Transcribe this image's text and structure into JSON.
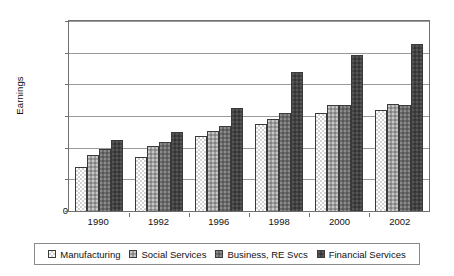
{
  "chart_data": {
    "type": "bar",
    "title": "",
    "xlabel": "",
    "ylabel": "Earnings",
    "ylim": [
      0,
      6000
    ],
    "yticks": [
      0,
      1000,
      2000,
      3000,
      4000,
      5000,
      6000
    ],
    "ytick_labels": [
      "0",
      "1,000",
      "2,000",
      "3,000",
      "4,000",
      "5,000",
      "6,000"
    ],
    "grid": true,
    "legend_position": "bottom",
    "categories": [
      "1990",
      "1992",
      "1996",
      "1998",
      "2000",
      "2002"
    ],
    "series": [
      {
        "name": "Manufacturing",
        "color": "#d2d2d2",
        "values": [
          1400,
          1720,
          2380,
          2760,
          3080,
          3180
        ]
      },
      {
        "name": "Social Services",
        "color": "#9d9d9d",
        "values": [
          1760,
          2060,
          2540,
          2900,
          3350,
          3380
        ]
      },
      {
        "name": "Business, RE Svcs",
        "color": "#6b6b6b",
        "values": [
          1950,
          2170,
          2700,
          3090,
          3350,
          3350
        ]
      },
      {
        "name": "Financial Services",
        "color": "#434343",
        "values": [
          2250,
          2480,
          3250,
          4400,
          4930,
          5280
        ]
      }
    ]
  },
  "legend": {
    "items": [
      {
        "label": "Manufacturing"
      },
      {
        "label": "Social Services"
      },
      {
        "label": "Business, RE Svcs"
      },
      {
        "label": "Financial Services"
      }
    ]
  }
}
